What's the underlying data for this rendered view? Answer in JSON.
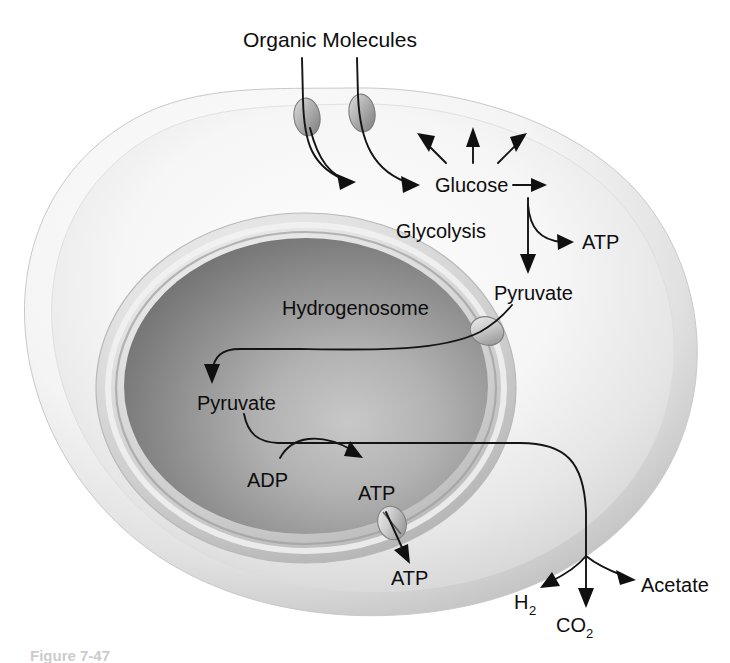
{
  "figure": {
    "domain": "biology-diagram",
    "caption": "Figure 7-47",
    "background_color": "#ffffff",
    "line_color": "#101010",
    "text_color": "#0d0d0d"
  },
  "labels": {
    "organic_molecules": "Organic Molecules",
    "glucose": "Glucose",
    "glycolysis": "Glycolysis",
    "atp_cytosol": "ATP",
    "pyruvate_cytosol": "Pyruvate",
    "hydrogenosome": "Hydrogenosome",
    "pyruvate_organelle": "Pyruvate",
    "adp": "ADP",
    "atp_organelle": "ATP",
    "atp_exported": "ATP",
    "hydrogen": "H",
    "hydrogen_sub": "2",
    "carbon_dioxide": "CO",
    "carbon_dioxide_sub": "2",
    "acetate": "Acetate"
  },
  "structures": {
    "cell": {
      "name": "anaerobic eukaryotic cell",
      "fill_light": "#fbfbfb",
      "fill_mid": "#e3e3e3",
      "fill_shadow": "#c2c2c2"
    },
    "hydrogenosome": {
      "name": "hydrogenosome organelle",
      "fill_outer": "#d6d6d6",
      "fill_inner_light": "#b4b4b4",
      "fill_inner_dark": "#6f6f6f"
    },
    "transporters": [
      {
        "name": "glucose-transporter-left",
        "cx": 307,
        "cy": 117
      },
      {
        "name": "glucose-transporter-right",
        "cx": 362,
        "cy": 113
      },
      {
        "name": "pyruvate-transporter",
        "cx": 487,
        "cy": 331
      },
      {
        "name": "atp-transporter",
        "cx": 392,
        "cy": 523
      }
    ]
  },
  "pathway": {
    "steps": [
      "Organic Molecules cross the plasma membrane through two transport proteins",
      "Glucose is produced in the cytosol",
      "Glycolysis converts Glucose to Pyruvate, generating ATP",
      "Pyruvate enters the hydrogenosome through a membrane transporter",
      "Inside the hydrogenosome Pyruvate plus ADP yields ATP",
      "ATP is exported from the hydrogenosome through a transporter",
      "Remaining products leave the cell as H2, CO2 and Acetate"
    ]
  }
}
